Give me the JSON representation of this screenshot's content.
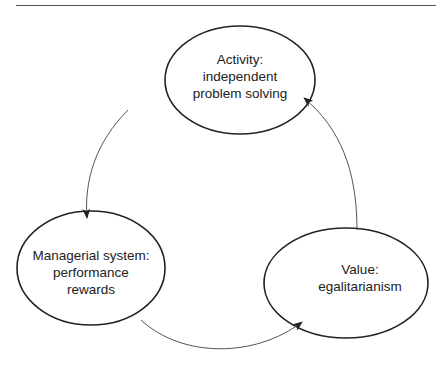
{
  "diagram": {
    "nodes": [
      {
        "id": "activity",
        "lines": [
          "Activity:",
          "independent",
          "problem solving"
        ]
      },
      {
        "id": "managerial",
        "lines": [
          "Managerial system:",
          "performance",
          "rewards"
        ]
      },
      {
        "id": "value",
        "lines": [
          "Value:",
          "egalitarianism"
        ]
      }
    ],
    "edges": [
      {
        "from": "activity",
        "to": "managerial"
      },
      {
        "from": "managerial",
        "to": "value"
      },
      {
        "from": "value",
        "to": "activity"
      }
    ],
    "colors": {
      "stroke": "#222222",
      "arrow": "#555555",
      "text": "#222222"
    }
  }
}
